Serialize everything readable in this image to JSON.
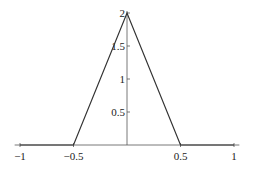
{
  "chart_data": {
    "type": "line",
    "title": "",
    "xlabel": "",
    "ylabel": "",
    "xlim": [
      -1.05,
      1.05
    ],
    "ylim": [
      0,
      2
    ],
    "grid": false,
    "legend": null,
    "series": [
      {
        "name": "triangle",
        "x": [
          -1,
          -0.5,
          0,
          0.5,
          1
        ],
        "y": [
          0,
          0,
          2,
          0,
          0
        ],
        "color": "#333333"
      }
    ],
    "x_ticks": [
      -1,
      -0.5,
      0.5,
      1
    ],
    "x_tick_labels": [
      "-1",
      "-0.5",
      "0.5",
      "1"
    ],
    "y_ticks": [
      0.5,
      1,
      1.5,
      2
    ],
    "y_tick_labels": [
      "0.5",
      "1",
      "1.5",
      "2"
    ]
  }
}
